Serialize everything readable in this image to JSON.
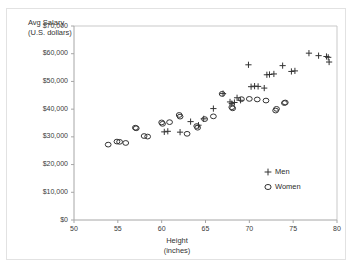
{
  "chart_data": {
    "type": "scatter",
    "title": "",
    "xlabel": "Height (inches)",
    "xlabel_line1": "Height",
    "xlabel_line2": "(inches)",
    "ylabel": "Avg Salary (U.S. dollars)",
    "ylabel_line1": "Avg Salary",
    "ylabel_line2": "(U.S. dollars)",
    "xlim": [
      50,
      80
    ],
    "ylim": [
      0,
      70000
    ],
    "xticks": [
      50,
      55,
      60,
      65,
      70,
      75,
      80
    ],
    "xtick_labels": [
      "50",
      "55",
      "60",
      "65",
      "70",
      "75",
      "80"
    ],
    "yticks": [
      0,
      10000,
      20000,
      30000,
      40000,
      50000,
      60000,
      70000
    ],
    "ytick_labels": [
      "$0",
      "$10,000",
      "$20,000",
      "$30,000",
      "$40,000",
      "$50,000",
      "$60,000",
      "$70,000"
    ],
    "grid": false,
    "legend_position": "inside-lower-right",
    "series": [
      {
        "name": "Men",
        "marker": "plus",
        "marker_glyph": "+",
        "color": "#333333",
        "points": [
          [
            60.3,
            31800
          ],
          [
            60.7,
            32000
          ],
          [
            62.1,
            31700
          ],
          [
            63.3,
            35500
          ],
          [
            64.2,
            34200
          ],
          [
            64.8,
            36500
          ],
          [
            65.9,
            40200
          ],
          [
            67.0,
            45600
          ],
          [
            67.8,
            42600
          ],
          [
            68.0,
            42000
          ],
          [
            68.3,
            42400
          ],
          [
            68.6,
            44100
          ],
          [
            69.0,
            43200
          ],
          [
            69.9,
            56000
          ],
          [
            70.2,
            48100
          ],
          [
            70.6,
            48300
          ],
          [
            71.0,
            48200
          ],
          [
            71.7,
            47600
          ],
          [
            72.0,
            52400
          ],
          [
            72.3,
            52500
          ],
          [
            72.8,
            52700
          ],
          [
            73.8,
            55700
          ],
          [
            74.8,
            53600
          ],
          [
            75.2,
            53800
          ],
          [
            76.8,
            60200
          ],
          [
            77.9,
            59300
          ],
          [
            78.8,
            59000
          ],
          [
            79.0,
            58700
          ],
          [
            79.1,
            57000
          ]
        ]
      },
      {
        "name": "Women",
        "marker": "circle",
        "marker_glyph": "○",
        "color": "#333333",
        "points": [
          [
            53.9,
            27200
          ],
          [
            54.9,
            28300
          ],
          [
            55.2,
            28200
          ],
          [
            55.9,
            27800
          ],
          [
            57.0,
            33300
          ],
          [
            57.1,
            33100
          ],
          [
            58.0,
            30300
          ],
          [
            58.4,
            30100
          ],
          [
            60.0,
            35200
          ],
          [
            60.1,
            34700
          ],
          [
            60.9,
            35300
          ],
          [
            62.0,
            37900
          ],
          [
            62.1,
            37300
          ],
          [
            62.9,
            31100
          ],
          [
            64.0,
            33900
          ],
          [
            64.1,
            33300
          ],
          [
            64.9,
            36400
          ],
          [
            65.9,
            37400
          ],
          [
            66.9,
            45500
          ],
          [
            68.0,
            40700
          ],
          [
            68.1,
            40300
          ],
          [
            69.1,
            43600
          ],
          [
            70.0,
            43700
          ],
          [
            70.9,
            43500
          ],
          [
            71.9,
            43100
          ],
          [
            73.0,
            39500
          ],
          [
            73.1,
            40100
          ],
          [
            74.0,
            42200
          ],
          [
            74.1,
            42400
          ]
        ]
      }
    ]
  },
  "legend": {
    "items": [
      {
        "mark": "+",
        "label": "Men"
      },
      {
        "mark": "○",
        "label": "Women"
      }
    ]
  },
  "colors": {
    "marker": "#333333",
    "axis": "#a6a6a6",
    "plot_border": "#c9c9c9",
    "frame": "#e2e2e2",
    "text": "#333333",
    "background": "#ffffff"
  }
}
